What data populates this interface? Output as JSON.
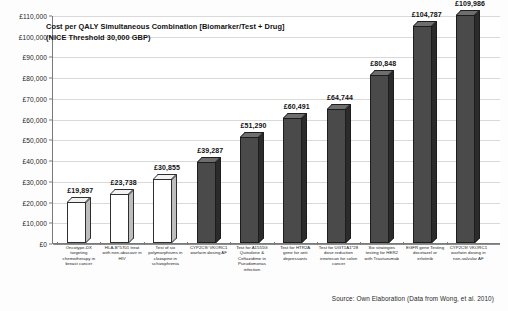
{
  "chart_data": {
    "type": "bar",
    "title": "Cost per QALY Simultaneous Combination [Biomarker/Test + Drug] (NICE Threshold 30,000 GBP)",
    "title_line1": "Cost per QALY Simultaneous Combination [Biomarker/Test + Drug]",
    "title_line2": "(NICE Threshold 30,000 GBP)",
    "xlabel": "",
    "ylabel": "",
    "ylim": [
      0,
      110000
    ],
    "grid": true,
    "legend": "none",
    "source": "Source: Own Elaboration (Data from Wong, et al. 2010)",
    "ytick_labels": [
      "£110,000",
      "£100,000",
      "£90,000",
      "£80,000",
      "£70,000",
      "£60,000",
      "£50,000",
      "£40,000",
      "£30,000",
      "£20,000",
      "£10,000",
      "£0"
    ],
    "ytick_values": [
      110000,
      100000,
      90000,
      80000,
      70000,
      60000,
      50000,
      40000,
      30000,
      20000,
      10000,
      0
    ],
    "categories": [
      "Oncotype-DX targeting chemotherapy in breast cancer",
      "HLA-B*5701 treat with non-abacavir in HIV",
      "Test of six polymorphisms in clozapine in schizophrenia",
      "CYP2C9/ VKORC1 warfarin dosing AF",
      "Test for A1555G Quinolone & Ceftazidime in Pseudomonas infection",
      "Test for HTR2A gene for anti depressants",
      "Test for UGT1A1*28 dose reduction irinotecan for colon cancer",
      "Six strategies testing for HER2 with Trastuzumab",
      "EGFR gene Testing docetaxel or erlotinib",
      "CYP2C9/ VKORC1 warfarin dosing in non-valvular AF"
    ],
    "values": [
      19897,
      23738,
      30855,
      39287,
      51290,
      60491,
      64744,
      80848,
      104787,
      109986
    ],
    "value_labels": [
      "£19,897",
      "£23,738",
      "£30,855",
      "£39,287",
      "£51,290",
      "£60,491",
      "£64,744",
      "£80,848",
      "£104,787",
      "£109,986"
    ],
    "bar_styles": [
      "light",
      "light",
      "light",
      "dark",
      "dark",
      "dark",
      "dark",
      "dark",
      "dark",
      "dark"
    ],
    "colors": {
      "bar_light": "#ffffff",
      "bar_dark": "#4a4a4a",
      "axis": "#7a7a7a",
      "grid": "#d9d9d9",
      "text": "#1a1a1a",
      "background": "#ffffff"
    }
  }
}
